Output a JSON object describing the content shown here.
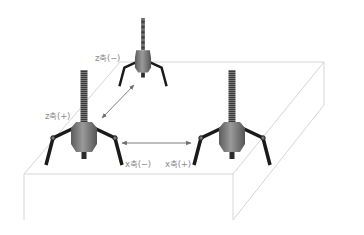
{
  "diagram": {
    "type": "robot-movement-axes",
    "labels": {
      "z_minus": "z축(−)",
      "z_plus": "z축(+)",
      "x_minus": "x축(−)",
      "x_plus": "x축(+)"
    },
    "robots": [
      {
        "id": "top",
        "position": "z(−)"
      },
      {
        "id": "left",
        "position": "origin"
      },
      {
        "id": "right",
        "position": "x(+)"
      }
    ],
    "colors": {
      "box_line": "#d6d6d6",
      "arrow": "#6e6e6e",
      "robot_leg": "#1a1a1a",
      "robot_body": "#7a7a7a",
      "label": "#8a8a8a"
    }
  }
}
